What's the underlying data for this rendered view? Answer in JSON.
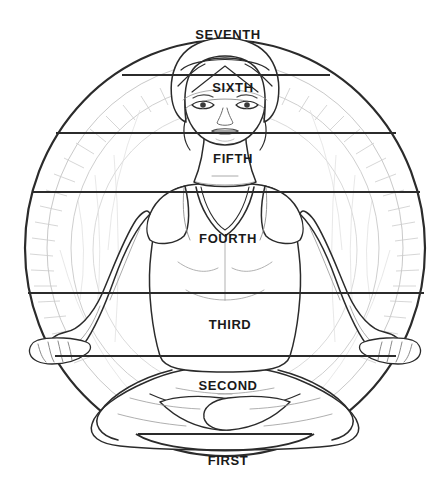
{
  "figure": {
    "background_color": "#ffffff",
    "ink_color": "#1a1a1a",
    "faint_ink_color": "#b8b8b8",
    "mid_ink_color": "#8a8a8a"
  },
  "mandala": {
    "name": "halo-circle",
    "center_x": 225,
    "center_y": 248,
    "radius_x": 200,
    "radius_y": 208,
    "inner_ring_inset": 22,
    "inner_ring_inset_2": 46
  },
  "chakra_levels": [
    {
      "id": "seventh",
      "label": "SEVENTH",
      "label_x": 228,
      "label_y": 34,
      "line_y": null,
      "line_x1": null,
      "line_x2": null,
      "body_region": "crown"
    },
    {
      "id": "sixth",
      "label": "SIXTH",
      "label_x": 233,
      "label_y": 87,
      "line_y": 75,
      "line_x1": 122,
      "line_x2": 330,
      "body_region": "brow"
    },
    {
      "id": "fifth",
      "label": "FIFTH",
      "label_x": 233,
      "label_y": 158,
      "line_y": 133,
      "line_x1": 56,
      "line_x2": 396,
      "body_region": "throat"
    },
    {
      "id": "fourth",
      "label": "FOURTH",
      "label_x": 228,
      "label_y": 238,
      "line_y": 192,
      "line_x1": 33,
      "line_x2": 420,
      "body_region": "heart"
    },
    {
      "id": "third",
      "label": "THIRD",
      "label_x": 230,
      "label_y": 324,
      "line_y": 293,
      "line_x1": 28,
      "line_x2": 424,
      "body_region": "solar-plexus"
    },
    {
      "id": "second",
      "label": "SECOND",
      "label_x": 228,
      "label_y": 385,
      "line_y": 356,
      "line_x1": 55,
      "line_x2": 396,
      "body_region": "sacral"
    },
    {
      "id": "first",
      "label": "FIRST",
      "label_x": 228,
      "label_y": 460,
      "line_y": 434,
      "line_x1": 138,
      "line_x2": 312,
      "body_region": "root"
    }
  ]
}
